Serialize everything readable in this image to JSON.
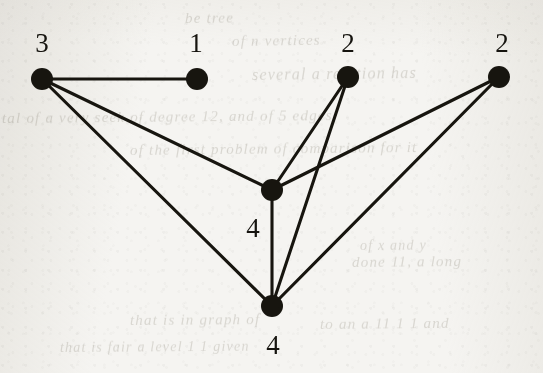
{
  "figure": {
    "kind": "undirected-graph-diagram",
    "caption_text": "",
    "background_color": "#f5f4f1",
    "ink_color": "#17150f",
    "node_radius": 11,
    "edge_width": 3.1,
    "width": 543,
    "height": 373
  },
  "graph_data": {
    "type": "node-link-graph",
    "directed": false,
    "node_count": 6,
    "edge_count": 8,
    "nodes": [
      {
        "id": "n1",
        "label": "3",
        "x": 42,
        "y": 79,
        "label_x": 42,
        "label_y": 43,
        "label_position": "above"
      },
      {
        "id": "n2",
        "label": "1",
        "x": 197,
        "y": 79,
        "label_x": 196,
        "label_y": 43,
        "label_position": "above"
      },
      {
        "id": "n3",
        "label": "2",
        "x": 348,
        "y": 77,
        "label_x": 348,
        "label_y": 43,
        "label_position": "above"
      },
      {
        "id": "n4",
        "label": "2",
        "x": 499,
        "y": 77,
        "label_x": 502,
        "label_y": 43,
        "label_position": "above"
      },
      {
        "id": "n5",
        "label": "4",
        "x": 272,
        "y": 190,
        "label_x": 253,
        "label_y": 228,
        "label_position": "below-left"
      },
      {
        "id": "n6",
        "label": "4",
        "x": 272,
        "y": 306,
        "label_x": 273,
        "label_y": 345,
        "label_position": "below"
      }
    ],
    "edges": [
      {
        "source": "n1",
        "target": "n2"
      },
      {
        "source": "n1",
        "target": "n5"
      },
      {
        "source": "n1",
        "target": "n6"
      },
      {
        "source": "n3",
        "target": "n5"
      },
      {
        "source": "n3",
        "target": "n6"
      },
      {
        "source": "n4",
        "target": "n5"
      },
      {
        "source": "n4",
        "target": "n6"
      },
      {
        "source": "n5",
        "target": "n6"
      }
    ],
    "degree_labels": {
      "note": "Each node is annotated with its degree",
      "values": [
        3,
        1,
        2,
        2,
        4,
        4
      ]
    }
  },
  "bleed_through": [
    {
      "text": "be tree",
      "x": 185,
      "y": 10,
      "size": 15,
      "rotate": -0.6
    },
    {
      "text": "of n vertices",
      "x": 232,
      "y": 33,
      "size": 15,
      "rotate": -0.8
    },
    {
      "text": "several a relation has",
      "x": 252,
      "y": 66,
      "size": 16,
      "rotate": -0.7
    },
    {
      "text": "tal of a very seek of degree 12, and of 5 edges",
      "x": 2,
      "y": 110,
      "size": 15,
      "rotate": -0.5
    },
    {
      "text": "of the first problem of comparison for it",
      "x": 130,
      "y": 142,
      "size": 15,
      "rotate": -0.6
    },
    {
      "text": "of x and y",
      "x": 360,
      "y": 238,
      "size": 14,
      "rotate": -0.4
    },
    {
      "text": "done 11, a long",
      "x": 352,
      "y": 254,
      "size": 15,
      "rotate": -0.5
    },
    {
      "text": "that is in graph of",
      "x": 130,
      "y": 312,
      "size": 15,
      "rotate": -0.4
    },
    {
      "text": "to an a 11 1 1 and",
      "x": 320,
      "y": 316,
      "size": 15,
      "rotate": -0.5
    },
    {
      "text": "that is fair a level 1 1 given",
      "x": 60,
      "y": 340,
      "size": 14,
      "rotate": -0.4
    }
  ]
}
